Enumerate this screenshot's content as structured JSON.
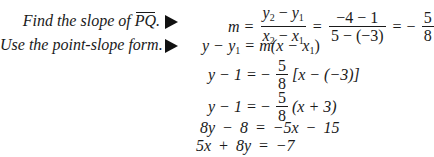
{
  "steps": [
    {
      "label": "Find the slope of ",
      "label_line": "PQ",
      "label_end": "."
    },
    {
      "label": "Use the point-slope form."
    }
  ],
  "icons": {
    "arrow": "right-triangle-arrow"
  },
  "equations": {
    "slope": {
      "lhs": "m",
      "f1_num_a": "y",
      "f1_num_a_sub": "2",
      "f1_num_b": "y",
      "f1_num_b_sub": "1",
      "f1_den_a": "x",
      "f1_den_a_sub": "2",
      "f1_den_b": "x",
      "f1_den_b_sub": "1",
      "f2_num": "−4 − 1",
      "f2_den": "5 − (−3)",
      "result_sign": "−",
      "result_num": "5",
      "result_den": "8"
    },
    "point_slope": {
      "text_a": "y",
      "minus": "−",
      "y1": "y",
      "y1_sub": "1",
      "eq": "=",
      "rhs_a": "m(",
      "rhs_x": "x",
      "rhs_minus": "−",
      "rhs_x1": "x",
      "rhs_x1_sub": "1",
      "rhs_close": ")"
    },
    "line3": {
      "lhs": "y − 1",
      "eq": "=",
      "sign": "−",
      "num": "5",
      "den": "8",
      "rest": "[x − (−3)]"
    },
    "line4": {
      "lhs": "y − 1",
      "eq": "=",
      "sign": "−",
      "num": "5",
      "den": "8",
      "rest": "(x + 3)"
    },
    "line5": {
      "text": "8y − 8 = −5x − 15"
    },
    "line6": {
      "text": "5x + 8y = −7"
    }
  }
}
